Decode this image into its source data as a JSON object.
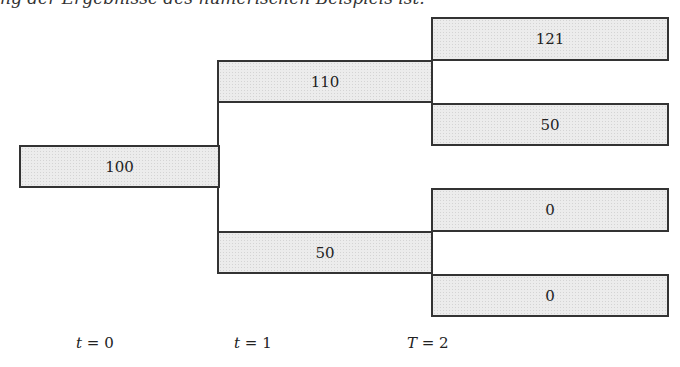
{
  "caption": "ng der Ergebnisse des numerischen Beispiels ist.",
  "tree": {
    "t0": {
      "value": "100"
    },
    "t1": [
      {
        "value": "110"
      },
      {
        "value": "50"
      }
    ],
    "t2": [
      {
        "value": "121"
      },
      {
        "value": "50"
      },
      {
        "value": "0"
      },
      {
        "value": "0"
      }
    ]
  },
  "axis": [
    {
      "var": "t",
      "eq": " = 0"
    },
    {
      "var": "t",
      "eq": " = 1"
    },
    {
      "var": "T",
      "eq": " = 2"
    }
  ]
}
